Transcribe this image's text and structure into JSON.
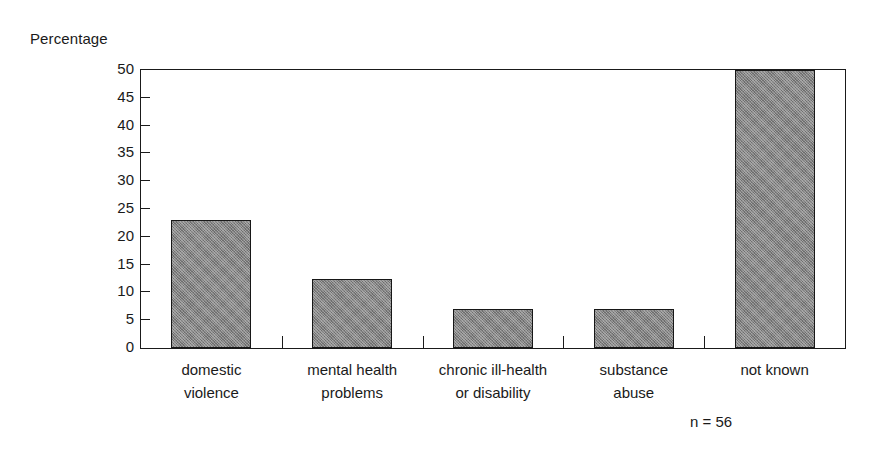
{
  "chart_data": {
    "type": "bar",
    "title": "",
    "subtitle": "",
    "xlabel": "",
    "ylabel": "Percentage",
    "ylim": [
      0,
      50
    ],
    "yticks": [
      0,
      5,
      10,
      15,
      20,
      25,
      30,
      35,
      40,
      45,
      50
    ],
    "ytick_labels": [
      "0",
      "5",
      "10",
      "15",
      "20",
      "25",
      "30",
      "35",
      "40",
      "45",
      "50"
    ],
    "grid": false,
    "legend": "none",
    "categories": [
      "domestic violence",
      "mental health problems",
      "chronic ill-health or disability",
      "substance abuse",
      "not known"
    ],
    "category_lines": [
      [
        "domestic",
        "violence"
      ],
      [
        "mental health",
        "problems"
      ],
      [
        "chronic ill-health",
        "or disability"
      ],
      [
        "substance",
        "abuse"
      ],
      [
        "not known",
        ""
      ]
    ],
    "values": [
      23,
      12.5,
      7,
      7,
      50
    ],
    "annotations": [
      "n = 56"
    ],
    "bar_color": "#838383",
    "bar_edge_color": "#171717",
    "axis_color": "#1a1a1a",
    "background_color": "#ffffff"
  },
  "axis": {
    "y_title": "Percentage"
  },
  "footnote": {
    "text": "n = 56"
  }
}
